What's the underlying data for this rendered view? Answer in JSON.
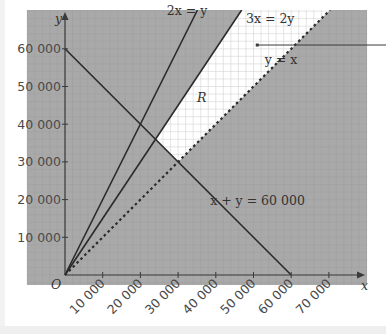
{
  "chart_data": {
    "type": "line",
    "title": "",
    "xlabel": "x",
    "ylabel": "y",
    "origin_label": "O",
    "xlim": [
      0,
      75000
    ],
    "ylim": [
      0,
      70000
    ],
    "x_ticks": [
      10000,
      20000,
      30000,
      40000,
      50000,
      60000,
      70000
    ],
    "x_tick_labels": [
      "10 000",
      "20 000",
      "30 000",
      "40 000",
      "50 000",
      "60 000",
      "70 000"
    ],
    "y_ticks": [
      10000,
      20000,
      30000,
      40000,
      50000,
      60000
    ],
    "y_tick_labels": [
      "10 000",
      "20 000",
      "30 000",
      "40 000",
      "50 000",
      "60 000"
    ],
    "grid": true,
    "series": [
      {
        "name": "2x = y",
        "equation": "y = 2x",
        "style": "solid",
        "points": [
          [
            0,
            0
          ],
          [
            35000,
            70000
          ]
        ]
      },
      {
        "name": "3x = 2y",
        "equation": "y = 1.5x",
        "style": "solid",
        "points": [
          [
            0,
            0
          ],
          [
            46667,
            70000
          ]
        ]
      },
      {
        "name": "y = x",
        "equation": "y = x",
        "style": "dashed",
        "points": [
          [
            0,
            0
          ],
          [
            70000,
            70000
          ]
        ]
      },
      {
        "name": "x + y = 60 000",
        "equation": "y = 60000 - x",
        "style": "solid",
        "points": [
          [
            0,
            60000
          ],
          [
            60000,
            0
          ]
        ]
      }
    ],
    "region": {
      "label": "R",
      "description": "Unshaded feasible region: y >= x, 3x >= 2y, x + y >= 60000",
      "vertices": [
        [
          30000,
          30000
        ],
        [
          24000,
          36000
        ],
        [
          46667,
          70000
        ],
        [
          70000,
          70000
        ]
      ]
    },
    "annotations": [
      {
        "text": "2x = y",
        "at": [
          27000,
          70000
        ]
      },
      {
        "text": "3x = 2y",
        "at": [
          48000,
          68000
        ]
      },
      {
        "text": "y = x",
        "at": [
          53000,
          57000
        ]
      },
      {
        "text": "R",
        "at": [
          35000,
          47000
        ]
      },
      {
        "text": "x + y = 60 000",
        "at": [
          38500,
          19500
        ]
      }
    ],
    "leader_line": {
      "from": [
        51000,
        61000
      ],
      "to_right_edge": true
    }
  },
  "colors": {
    "shaded": "#a9a9a9",
    "grid_on_shaded": "#9e9e9e",
    "feasible": "#ffffff",
    "grid_on_feasible": "#d4d4d4",
    "line": "#2a2a2a",
    "text": "#4a4a4a"
  }
}
